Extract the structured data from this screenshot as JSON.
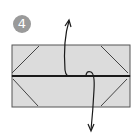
{
  "step": {
    "number": "4"
  },
  "colors": {
    "paper": "#dcdcdc",
    "outline": "#555555",
    "crease": "#1a1a1a",
    "badge": "#9a9a9a"
  },
  "diagram": {
    "arrows": [
      "up",
      "down"
    ]
  }
}
